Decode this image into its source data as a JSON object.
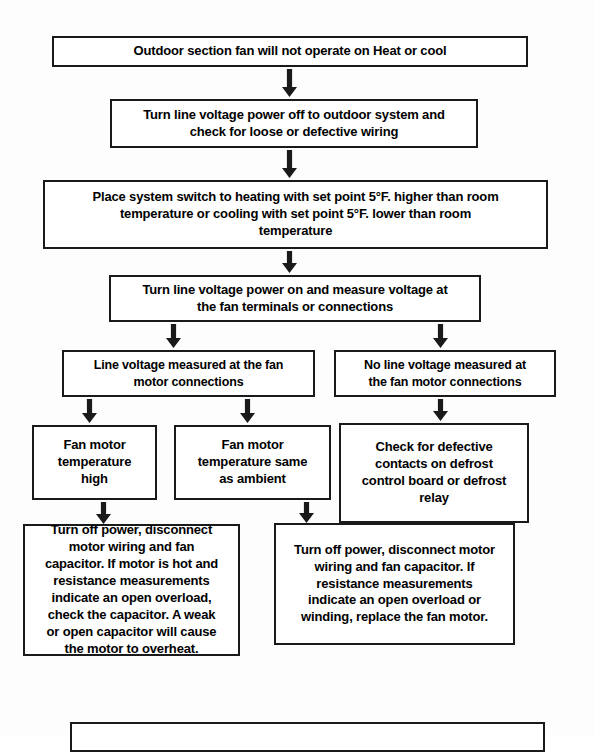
{
  "diagram": {
    "background_color": "#fdfdfd",
    "line_color": "#1a1a1a",
    "nodes": [
      {
        "id": "symptom",
        "name": "symptom-box",
        "text": "Outdoor section fan will not operate on Heat or cool",
        "x": 52,
        "y": 36,
        "w": 476,
        "h": 31,
        "font_size": 13
      },
      {
        "id": "power-off",
        "name": "power-off-box",
        "text": "Turn line voltage power off to outdoor system  and\ncheck for loose or defective wiring",
        "x": 110,
        "y": 99,
        "w": 368,
        "h": 49,
        "font_size": 13
      },
      {
        "id": "set-point",
        "name": "set-point-box",
        "text": "Place system switch to heating  with set point 5°F. higher than room\ntemperature  or cooling with  set point 5°F. lower than room\ntemperature",
        "x": 43,
        "y": 180,
        "w": 505,
        "h": 69,
        "font_size": 13
      },
      {
        "id": "measure-voltage",
        "name": "measure-voltage-box",
        "text": "Turn line voltage power on and measure voltage at\nthe fan terminals or connections",
        "x": 109,
        "y": 275,
        "w": 372,
        "h": 47,
        "font_size": 13
      },
      {
        "id": "line-voltage-present",
        "name": "line-voltage-present-box",
        "text": "Line voltage  measured at the fan\nmotor connections",
        "x": 62,
        "y": 350,
        "w": 253,
        "h": 47,
        "font_size": 12.5
      },
      {
        "id": "no-line-voltage",
        "name": "no-line-voltage-box",
        "text": "No line voltage  measured at\nthe fan motor connections",
        "x": 334,
        "y": 350,
        "w": 222,
        "h": 47,
        "font_size": 12.5
      },
      {
        "id": "motor-temp-high",
        "name": "motor-temp-high-box",
        "text": "Fan motor\ntemperature\nhigh",
        "x": 32,
        "y": 425,
        "w": 125,
        "h": 75,
        "font_size": 13
      },
      {
        "id": "motor-temp-ambient",
        "name": "motor-temp-ambient-box",
        "text": "Fan motor\ntemperature same\nas ambient",
        "x": 174,
        "y": 425,
        "w": 157,
        "h": 75,
        "font_size": 13
      },
      {
        "id": "check-defrost",
        "name": "check-defrost-box",
        "text": "Check for defective\ncontacts on defrost\ncontrol board or defrost\nrelay",
        "x": 339,
        "y": 423,
        "w": 190,
        "h": 100,
        "font_size": 13
      },
      {
        "id": "capacitor-check",
        "name": "capacitor-check-box",
        "text": "Turn off power, disconnect\nmotor wiring and fan\ncapacitor.  If motor is hot and\nresistance measurements\nindicate an open overload,\ncheck the capacitor.  A weak\nor open capacitor will cause\nthe motor to overheat.",
        "x": 23,
        "y": 524,
        "w": 217,
        "h": 132,
        "font_size": 13
      },
      {
        "id": "replace-motor",
        "name": "replace-motor-box",
        "text": "Turn off power, disconnect motor\nwiring and fan capacitor.  If\nresistance measurements\nindicate an open overload or\nwinding, replace the fan motor.",
        "x": 274,
        "y": 523,
        "w": 241,
        "h": 122,
        "font_size": 13
      },
      {
        "id": "bottom-empty",
        "name": "bottom-cutoff-box",
        "text": "",
        "x": 70,
        "y": 722,
        "w": 475,
        "h": 30,
        "font_size": 13
      }
    ],
    "arrows": [
      {
        "name": "arrow-symptom-to-power-off",
        "x": 289,
        "y": 69,
        "h": 28
      },
      {
        "name": "arrow-power-off-to-set-point",
        "x": 289,
        "y": 150,
        "h": 28
      },
      {
        "name": "arrow-set-point-to-measure",
        "x": 289,
        "y": 251,
        "h": 22
      },
      {
        "name": "arrow-measure-to-line-voltage",
        "x": 173,
        "y": 324,
        "h": 24
      },
      {
        "name": "arrow-measure-to-no-line-voltage",
        "x": 440,
        "y": 324,
        "h": 24
      },
      {
        "name": "arrow-line-voltage-to-temp-high",
        "x": 89,
        "y": 399,
        "h": 24
      },
      {
        "name": "arrow-line-voltage-to-temp-ambient",
        "x": 247,
        "y": 399,
        "h": 24
      },
      {
        "name": "arrow-no-line-voltage-to-defrost",
        "x": 440,
        "y": 399,
        "h": 22
      },
      {
        "name": "arrow-temp-high-to-capacitor",
        "x": 103,
        "y": 502,
        "h": 22
      },
      {
        "name": "arrow-temp-ambient-to-replace",
        "x": 306,
        "y": 502,
        "h": 21
      }
    ]
  }
}
